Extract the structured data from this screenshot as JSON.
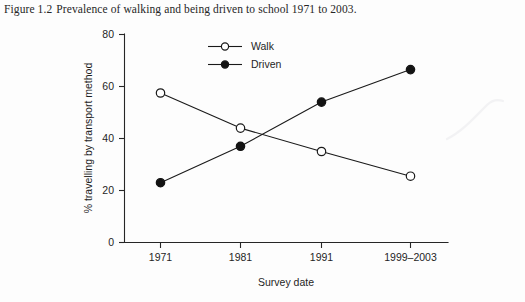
{
  "caption": {
    "number": "Figure 1.2",
    "text": "Prevalence of walking and being driven to school 1971 to 2003."
  },
  "chart_data": {
    "type": "line",
    "title": "",
    "xlabel": "Survey date",
    "ylabel": "% travelling by transport method",
    "categories": [
      "1971",
      "1981",
      "1991",
      "1999–2003"
    ],
    "series": [
      {
        "name": "Walk",
        "marker": "open-circle",
        "values": [
          57.5,
          44,
          35,
          25.5
        ]
      },
      {
        "name": "Driven",
        "marker": "filled-circle",
        "values": [
          23,
          37,
          54,
          66.5
        ]
      }
    ],
    "ylim": [
      0,
      80
    ],
    "yticks": [
      0,
      20,
      40,
      60,
      80
    ],
    "ytick_labels": [
      "0",
      "20",
      "40",
      "60",
      "80"
    ],
    "grid": false,
    "legend_position": "top-center",
    "line_color": "#1a1a1a",
    "axis_color": "#262626"
  }
}
